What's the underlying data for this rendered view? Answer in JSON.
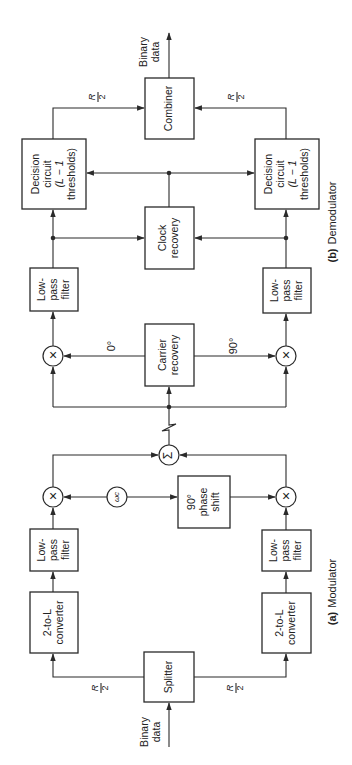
{
  "diagram": {
    "orientation": "rotated 90° counter-clockwise (text reads bottom-to-top)",
    "demodulator": {
      "caption_tag": "(b)",
      "caption_text": "Demodulator",
      "combiner": "Combiner",
      "output": {
        "line1": "Binary",
        "line2": "data"
      },
      "rate_top": {
        "num": "R",
        "den": "2"
      },
      "rate_bottom": {
        "num": "R",
        "den": "2"
      },
      "decision_top": {
        "line1": "Decision",
        "line2": "circuit",
        "line3": "(L − 1",
        "line4": "thresholds)"
      },
      "decision_bottom": {
        "line1": "Decision",
        "line2": "circuit",
        "line3": "(L − 1",
        "line4": "thresholds)"
      },
      "clock": {
        "line1": "Clock",
        "line2": "recovery"
      },
      "lpf_top": {
        "line1": "Low-",
        "line2": "pass",
        "line3": "filter"
      },
      "lpf_bottom": {
        "line1": "Low-",
        "line2": "pass",
        "line3": "filter"
      },
      "carrier": {
        "line1": "Carrier",
        "line2": "recovery"
      },
      "phase_0": "0°",
      "phase_90": "90°",
      "mixer_symbol": "×"
    },
    "channel": {
      "sum_symbol": "Σ"
    },
    "modulator": {
      "caption_tag": "(a)",
      "caption_text": "Modulator",
      "oscillator": "ωc",
      "phase_shift": {
        "line1": "90°",
        "line2": "phase",
        "line3": "shift"
      },
      "mixer_symbol": "×",
      "lpf_top": {
        "line1": "Low-",
        "line2": "pass",
        "line3": "filter"
      },
      "lpf_bottom": {
        "line1": "Low-",
        "line2": "pass",
        "line3": "filter"
      },
      "conv_top": {
        "line1": "2-to-L",
        "line2": "converter"
      },
      "conv_bottom": {
        "line1": "2-to-L",
        "line2": "converter"
      },
      "splitter": "Splitter",
      "rate_top": {
        "num": "R",
        "den": "2"
      },
      "rate_bottom": {
        "num": "R",
        "den": "2"
      },
      "input": {
        "line1": "Binary",
        "line2": "data"
      }
    }
  }
}
